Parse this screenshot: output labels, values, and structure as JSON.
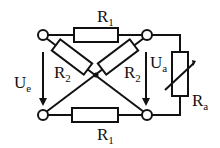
{
  "diagram": {
    "type": "circuit",
    "components": {
      "r1_top": {
        "label": "R",
        "sub": "1"
      },
      "r1_bottom": {
        "label": "R",
        "sub": "1"
      },
      "r2_left": {
        "label": "R",
        "sub": "2"
      },
      "r2_right": {
        "label": "R",
        "sub": "2"
      },
      "ra": {
        "label": "R",
        "sub": "a",
        "variable": true
      }
    },
    "voltages": {
      "input": {
        "label": "U",
        "sub": "e"
      },
      "output": {
        "label": "U",
        "sub": "a"
      }
    },
    "colors": {
      "stroke": "#111111",
      "background": "#ffffff"
    }
  }
}
